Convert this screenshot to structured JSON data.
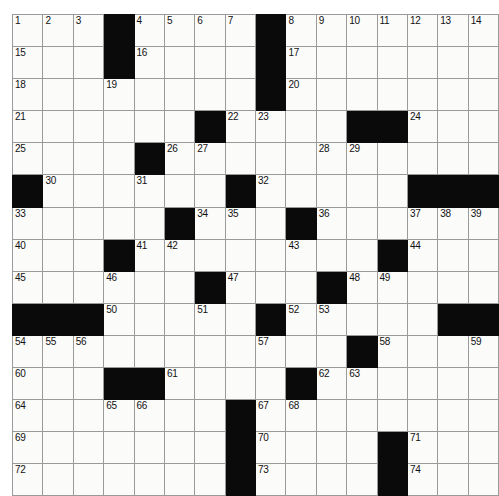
{
  "puzzle": {
    "type": "crossword-grid",
    "rows": 14,
    "columns": 15,
    "cell_size_px": 31,
    "colors": {
      "block": "#0a0a0a",
      "open": "#fbfbfa",
      "gridline": "#9a9a9a",
      "number_text": "#111111"
    },
    "grid": [
      [
        {
          "block": false,
          "num": "1"
        },
        {
          "block": false,
          "num": "2"
        },
        {
          "block": false,
          "num": "3"
        },
        {
          "block": true,
          "num": ""
        },
        {
          "block": false,
          "num": "4"
        },
        {
          "block": false,
          "num": "5"
        },
        {
          "block": false,
          "num": "6"
        },
        {
          "block": false,
          "num": "7"
        },
        {
          "block": true,
          "num": ""
        },
        {
          "block": false,
          "num": "8"
        },
        {
          "block": false,
          "num": "9"
        },
        {
          "block": false,
          "num": "10"
        },
        {
          "block": false,
          "num": "11"
        },
        {
          "block": false,
          "num": "12"
        },
        {
          "block": false,
          "num": "13"
        },
        {
          "block": false,
          "num": "14"
        }
      ],
      [
        {
          "block": false,
          "num": "15"
        },
        {
          "block": false,
          "num": ""
        },
        {
          "block": false,
          "num": ""
        },
        {
          "block": true,
          "num": ""
        },
        {
          "block": false,
          "num": "16"
        },
        {
          "block": false,
          "num": ""
        },
        {
          "block": false,
          "num": ""
        },
        {
          "block": false,
          "num": ""
        },
        {
          "block": true,
          "num": ""
        },
        {
          "block": false,
          "num": "17"
        },
        {
          "block": false,
          "num": ""
        },
        {
          "block": false,
          "num": ""
        },
        {
          "block": false,
          "num": ""
        },
        {
          "block": false,
          "num": ""
        },
        {
          "block": false,
          "num": ""
        },
        {
          "block": false,
          "num": ""
        }
      ],
      [
        {
          "block": false,
          "num": "18"
        },
        {
          "block": false,
          "num": ""
        },
        {
          "block": false,
          "num": ""
        },
        {
          "block": false,
          "num": "19"
        },
        {
          "block": false,
          "num": ""
        },
        {
          "block": false,
          "num": ""
        },
        {
          "block": false,
          "num": ""
        },
        {
          "block": false,
          "num": ""
        },
        {
          "block": true,
          "num": ""
        },
        {
          "block": false,
          "num": "20"
        },
        {
          "block": false,
          "num": ""
        },
        {
          "block": false,
          "num": ""
        },
        {
          "block": false,
          "num": ""
        },
        {
          "block": false,
          "num": ""
        },
        {
          "block": false,
          "num": ""
        },
        {
          "block": false,
          "num": ""
        }
      ],
      [
        {
          "block": false,
          "num": "21"
        },
        {
          "block": false,
          "num": ""
        },
        {
          "block": false,
          "num": ""
        },
        {
          "block": false,
          "num": ""
        },
        {
          "block": false,
          "num": ""
        },
        {
          "block": false,
          "num": ""
        },
        {
          "block": true,
          "num": ""
        },
        {
          "block": false,
          "num": "22"
        },
        {
          "block": false,
          "num": "23"
        },
        {
          "block": false,
          "num": ""
        },
        {
          "block": false,
          "num": ""
        },
        {
          "block": true,
          "num": ""
        },
        {
          "block": true,
          "num": ""
        },
        {
          "block": false,
          "num": "24"
        },
        {
          "block": false,
          "num": ""
        },
        {
          "block": false,
          "num": ""
        }
      ],
      [
        {
          "block": false,
          "num": "25"
        },
        {
          "block": false,
          "num": ""
        },
        {
          "block": false,
          "num": ""
        },
        {
          "block": false,
          "num": ""
        },
        {
          "block": true,
          "num": ""
        },
        {
          "block": false,
          "num": "26"
        },
        {
          "block": false,
          "num": "27"
        },
        {
          "block": false,
          "num": ""
        },
        {
          "block": false,
          "num": ""
        },
        {
          "block": false,
          "num": ""
        },
        {
          "block": false,
          "num": "28"
        },
        {
          "block": false,
          "num": "29"
        },
        {
          "block": false,
          "num": ""
        },
        {
          "block": false,
          "num": ""
        },
        {
          "block": false,
          "num": ""
        },
        {
          "block": false,
          "num": ""
        }
      ],
      [
        {
          "block": true,
          "num": ""
        },
        {
          "block": false,
          "num": "30"
        },
        {
          "block": false,
          "num": ""
        },
        {
          "block": false,
          "num": ""
        },
        {
          "block": false,
          "num": "31"
        },
        {
          "block": false,
          "num": ""
        },
        {
          "block": false,
          "num": ""
        },
        {
          "block": true,
          "num": ""
        },
        {
          "block": false,
          "num": "32"
        },
        {
          "block": false,
          "num": ""
        },
        {
          "block": false,
          "num": ""
        },
        {
          "block": false,
          "num": ""
        },
        {
          "block": false,
          "num": ""
        },
        {
          "block": true,
          "num": ""
        },
        {
          "block": true,
          "num": ""
        },
        {
          "block": true,
          "num": ""
        }
      ],
      [
        {
          "block": false,
          "num": "33"
        },
        {
          "block": false,
          "num": ""
        },
        {
          "block": false,
          "num": ""
        },
        {
          "block": false,
          "num": ""
        },
        {
          "block": false,
          "num": ""
        },
        {
          "block": true,
          "num": ""
        },
        {
          "block": false,
          "num": "34"
        },
        {
          "block": false,
          "num": "35"
        },
        {
          "block": false,
          "num": ""
        },
        {
          "block": true,
          "num": ""
        },
        {
          "block": false,
          "num": "36"
        },
        {
          "block": false,
          "num": ""
        },
        {
          "block": false,
          "num": ""
        },
        {
          "block": false,
          "num": "37"
        },
        {
          "block": false,
          "num": "38"
        },
        {
          "block": false,
          "num": "39"
        }
      ],
      [
        {
          "block": false,
          "num": "40"
        },
        {
          "block": false,
          "num": ""
        },
        {
          "block": false,
          "num": ""
        },
        {
          "block": true,
          "num": ""
        },
        {
          "block": false,
          "num": "41"
        },
        {
          "block": false,
          "num": "42"
        },
        {
          "block": false,
          "num": ""
        },
        {
          "block": false,
          "num": ""
        },
        {
          "block": false,
          "num": ""
        },
        {
          "block": false,
          "num": "43"
        },
        {
          "block": false,
          "num": ""
        },
        {
          "block": false,
          "num": ""
        },
        {
          "block": true,
          "num": ""
        },
        {
          "block": false,
          "num": "44"
        },
        {
          "block": false,
          "num": ""
        },
        {
          "block": false,
          "num": ""
        }
      ],
      [
        {
          "block": false,
          "num": "45"
        },
        {
          "block": false,
          "num": ""
        },
        {
          "block": false,
          "num": ""
        },
        {
          "block": false,
          "num": "46"
        },
        {
          "block": false,
          "num": ""
        },
        {
          "block": false,
          "num": ""
        },
        {
          "block": true,
          "num": ""
        },
        {
          "block": false,
          "num": "47"
        },
        {
          "block": false,
          "num": ""
        },
        {
          "block": false,
          "num": ""
        },
        {
          "block": true,
          "num": ""
        },
        {
          "block": false,
          "num": "48"
        },
        {
          "block": false,
          "num": "49"
        },
        {
          "block": false,
          "num": ""
        },
        {
          "block": false,
          "num": ""
        },
        {
          "block": false,
          "num": ""
        }
      ],
      [
        {
          "block": true,
          "num": ""
        },
        {
          "block": true,
          "num": ""
        },
        {
          "block": true,
          "num": ""
        },
        {
          "block": false,
          "num": "50"
        },
        {
          "block": false,
          "num": ""
        },
        {
          "block": false,
          "num": ""
        },
        {
          "block": false,
          "num": "51"
        },
        {
          "block": false,
          "num": ""
        },
        {
          "block": true,
          "num": ""
        },
        {
          "block": false,
          "num": "52"
        },
        {
          "block": false,
          "num": "53"
        },
        {
          "block": false,
          "num": ""
        },
        {
          "block": false,
          "num": ""
        },
        {
          "block": false,
          "num": ""
        },
        {
          "block": true,
          "num": ""
        },
        {
          "block": true,
          "num": ""
        }
      ],
      [
        {
          "block": false,
          "num": "54"
        },
        {
          "block": false,
          "num": "55"
        },
        {
          "block": false,
          "num": "56"
        },
        {
          "block": false,
          "num": ""
        },
        {
          "block": false,
          "num": ""
        },
        {
          "block": false,
          "num": ""
        },
        {
          "block": false,
          "num": ""
        },
        {
          "block": false,
          "num": ""
        },
        {
          "block": false,
          "num": "57"
        },
        {
          "block": false,
          "num": ""
        },
        {
          "block": false,
          "num": ""
        },
        {
          "block": true,
          "num": ""
        },
        {
          "block": false,
          "num": "58"
        },
        {
          "block": false,
          "num": ""
        },
        {
          "block": false,
          "num": ""
        },
        {
          "block": false,
          "num": "59"
        }
      ],
      [
        {
          "block": false,
          "num": "60"
        },
        {
          "block": false,
          "num": ""
        },
        {
          "block": false,
          "num": ""
        },
        {
          "block": true,
          "num": ""
        },
        {
          "block": true,
          "num": ""
        },
        {
          "block": false,
          "num": "61"
        },
        {
          "block": false,
          "num": ""
        },
        {
          "block": false,
          "num": ""
        },
        {
          "block": false,
          "num": ""
        },
        {
          "block": true,
          "num": ""
        },
        {
          "block": false,
          "num": "62"
        },
        {
          "block": false,
          "num": "63"
        },
        {
          "block": false,
          "num": ""
        },
        {
          "block": false,
          "num": ""
        },
        {
          "block": false,
          "num": ""
        },
        {
          "block": false,
          "num": ""
        }
      ],
      [
        {
          "block": false,
          "num": "64"
        },
        {
          "block": false,
          "num": ""
        },
        {
          "block": false,
          "num": ""
        },
        {
          "block": false,
          "num": "65"
        },
        {
          "block": false,
          "num": "66"
        },
        {
          "block": false,
          "num": ""
        },
        {
          "block": false,
          "num": ""
        },
        {
          "block": true,
          "num": ""
        },
        {
          "block": false,
          "num": "67"
        },
        {
          "block": false,
          "num": "68"
        },
        {
          "block": false,
          "num": ""
        },
        {
          "block": false,
          "num": ""
        },
        {
          "block": false,
          "num": ""
        },
        {
          "block": false,
          "num": ""
        },
        {
          "block": false,
          "num": ""
        },
        {
          "block": false,
          "num": ""
        }
      ],
      [
        {
          "block": false,
          "num": "69"
        },
        {
          "block": false,
          "num": ""
        },
        {
          "block": false,
          "num": ""
        },
        {
          "block": false,
          "num": ""
        },
        {
          "block": false,
          "num": ""
        },
        {
          "block": false,
          "num": ""
        },
        {
          "block": false,
          "num": ""
        },
        {
          "block": true,
          "num": ""
        },
        {
          "block": false,
          "num": "70"
        },
        {
          "block": false,
          "num": ""
        },
        {
          "block": false,
          "num": ""
        },
        {
          "block": false,
          "num": ""
        },
        {
          "block": true,
          "num": ""
        },
        {
          "block": false,
          "num": "71"
        },
        {
          "block": false,
          "num": ""
        },
        {
          "block": false,
          "num": ""
        }
      ],
      [
        {
          "block": false,
          "num": "72"
        },
        {
          "block": false,
          "num": ""
        },
        {
          "block": false,
          "num": ""
        },
        {
          "block": false,
          "num": ""
        },
        {
          "block": false,
          "num": ""
        },
        {
          "block": false,
          "num": ""
        },
        {
          "block": false,
          "num": ""
        },
        {
          "block": true,
          "num": ""
        },
        {
          "block": false,
          "num": "73"
        },
        {
          "block": false,
          "num": ""
        },
        {
          "block": false,
          "num": ""
        },
        {
          "block": false,
          "num": ""
        },
        {
          "block": true,
          "num": ""
        },
        {
          "block": false,
          "num": "74"
        },
        {
          "block": false,
          "num": ""
        },
        {
          "block": false,
          "num": ""
        }
      ]
    ]
  }
}
